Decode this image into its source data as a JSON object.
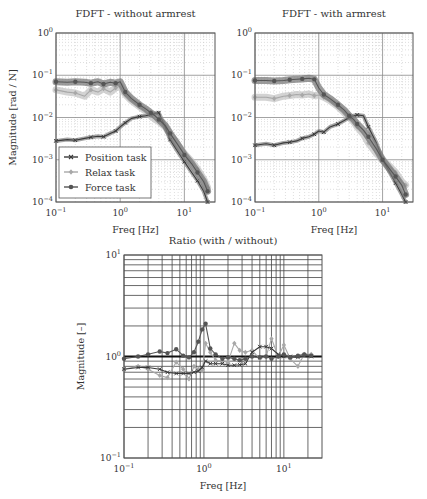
{
  "colors": {
    "position": "#3a3a3a",
    "relax": "#a8a8a8",
    "force": "#555555",
    "band_position": "#8a8a8a",
    "band_relax": "#c4c4c4",
    "band_force": "#7a7a7a",
    "grid_major": "#8c8c8c",
    "grid_minor": "#c8c8c8",
    "frame": "#555555"
  },
  "legend": {
    "items": [
      {
        "label": "Position task",
        "series": "position",
        "marker": "x"
      },
      {
        "label": "Relax task",
        "series": "relax",
        "marker": "diamond"
      },
      {
        "label": "Force task",
        "series": "force",
        "marker": "circle"
      }
    ]
  },
  "chart_data": [
    {
      "type": "line",
      "title": "FDFT - without armrest",
      "xlabel": "Freq [Hz]",
      "ylabel": "Magnitude [rad / N]",
      "xscale": "log",
      "yscale": "log",
      "xlim": [
        0.1,
        30
      ],
      "ylim": [
        0.0001,
        1
      ],
      "xticks": [
        "10^-1",
        "10^0",
        "10^1"
      ],
      "yticks": [
        "10^-4",
        "10^-3",
        "10^-2",
        "10^-1",
        "10^0"
      ],
      "grid": true,
      "legend_position": "lower left",
      "x": [
        0.1,
        0.15,
        0.2,
        0.28,
        0.35,
        0.45,
        0.55,
        0.7,
        0.85,
        1.0,
        1.2,
        1.5,
        2.0,
        2.5,
        3.0,
        3.5,
        4.0,
        5.0,
        6.0,
        8.0,
        10.0,
        13.0,
        16.0,
        20.0,
        23.0
      ],
      "series": [
        {
          "name": "Position task",
          "key": "position",
          "values": [
            0.0028,
            0.003,
            0.0029,
            0.0032,
            0.0034,
            0.0036,
            0.0035,
            0.0042,
            0.0048,
            0.006,
            0.0075,
            0.0095,
            0.0105,
            0.011,
            0.0118,
            0.0125,
            0.013,
            0.006,
            0.003,
            0.0015,
            0.0009,
            0.0005,
            0.00032,
            0.00018,
            0.0001
          ]
        },
        {
          "name": "Relax task",
          "key": "relax",
          "values": [
            0.045,
            0.04,
            0.038,
            0.032,
            0.045,
            0.04,
            0.048,
            0.04,
            0.05,
            0.055,
            0.035,
            0.025,
            0.018,
            0.014,
            0.011,
            0.009,
            0.008,
            0.006,
            0.004,
            0.0022,
            0.0014,
            0.0009,
            0.0006,
            0.00035,
            0.00022
          ]
        },
        {
          "name": "Force task",
          "key": "force",
          "values": [
            0.07,
            0.068,
            0.07,
            0.068,
            0.065,
            0.07,
            0.062,
            0.068,
            0.065,
            0.07,
            0.04,
            0.028,
            0.02,
            0.016,
            0.013,
            0.011,
            0.009,
            0.0065,
            0.0042,
            0.0022,
            0.0013,
            0.0008,
            0.0005,
            0.0003,
            0.00018
          ]
        }
      ]
    },
    {
      "type": "line",
      "title": "FDFT - with armrest",
      "xlabel": "Freq [Hz]",
      "ylabel": "",
      "xscale": "log",
      "yscale": "log",
      "xlim": [
        0.1,
        30
      ],
      "ylim": [
        0.0001,
        1
      ],
      "xticks": [
        "10^-1",
        "10^0",
        "10^1"
      ],
      "yticks": [
        "10^-4",
        "10^-3",
        "10^-2",
        "10^-1",
        "10^0"
      ],
      "grid": true,
      "x": [
        0.1,
        0.15,
        0.2,
        0.28,
        0.35,
        0.45,
        0.55,
        0.7,
        0.85,
        1.0,
        1.2,
        1.5,
        2.0,
        2.5,
        3.0,
        3.5,
        4.0,
        5.0,
        6.0,
        8.0,
        10.0,
        13.0,
        16.0,
        20.0,
        23.0
      ],
      "series": [
        {
          "name": "Position task",
          "key": "position",
          "values": [
            0.0022,
            0.0024,
            0.0022,
            0.0025,
            0.0026,
            0.0028,
            0.0032,
            0.0035,
            0.004,
            0.0048,
            0.0045,
            0.006,
            0.007,
            0.0085,
            0.01,
            0.011,
            0.0115,
            0.011,
            0.006,
            0.0025,
            0.001,
            0.0005,
            0.00028,
            0.00015,
            0.0001
          ]
        },
        {
          "name": "Relax task",
          "key": "relax",
          "values": [
            0.03,
            0.03,
            0.028,
            0.032,
            0.033,
            0.035,
            0.034,
            0.036,
            0.033,
            0.034,
            0.03,
            0.025,
            0.018,
            0.013,
            0.01,
            0.008,
            0.006,
            0.004,
            0.0025,
            0.0014,
            0.001,
            0.0007,
            0.0005,
            0.0003,
            0.00025
          ]
        },
        {
          "name": "Force task",
          "key": "force",
          "values": [
            0.075,
            0.075,
            0.073,
            0.075,
            0.078,
            0.08,
            0.082,
            0.085,
            0.08,
            0.05,
            0.035,
            0.028,
            0.02,
            0.015,
            0.011,
            0.009,
            0.007,
            0.005,
            0.0035,
            0.0018,
            0.001,
            0.0006,
            0.0004,
            0.00025,
            0.00015
          ]
        }
      ]
    },
    {
      "type": "line",
      "title": "Ratio (with / without)",
      "xlabel": "Freq [Hz]",
      "ylabel": "Magnitude [–]",
      "xscale": "log",
      "yscale": "log",
      "xlim": [
        0.1,
        30
      ],
      "ylim": [
        0.1,
        10
      ],
      "xticks": [
        "10^-1",
        "10^0",
        "10^1"
      ],
      "yticks": [
        "10^-1",
        "10^0",
        "10^1"
      ],
      "grid": true,
      "reference_line": 1.0,
      "x": [
        0.1,
        0.15,
        0.2,
        0.28,
        0.35,
        0.45,
        0.55,
        0.65,
        0.75,
        0.85,
        0.95,
        1.05,
        1.2,
        1.4,
        1.7,
        2.0,
        2.4,
        2.8,
        3.3,
        4.0,
        5.0,
        6.0,
        7.0,
        8.5,
        10.0,
        12.0,
        15.0,
        18.0,
        22.0
      ],
      "series": [
        {
          "name": "Position task",
          "key": "position",
          "values": [
            0.75,
            0.78,
            0.78,
            0.75,
            0.7,
            0.68,
            0.68,
            0.68,
            0.7,
            0.72,
            0.78,
            0.9,
            0.85,
            0.85,
            0.85,
            0.82,
            0.82,
            0.83,
            0.85,
            1.1,
            1.25,
            1.25,
            1.2,
            1.05,
            1.0,
            1.0,
            0.98,
            1.02,
            1.0
          ]
        },
        {
          "name": "Relax task",
          "key": "relax",
          "values": [
            0.75,
            0.8,
            0.75,
            0.65,
            0.62,
            0.88,
            0.75,
            0.6,
            0.8,
            0.75,
            0.72,
            1.35,
            1.1,
            0.92,
            0.9,
            0.88,
            1.35,
            1.15,
            1.1,
            1.15,
            0.95,
            1.0,
            1.5,
            1.0,
            1.3,
            0.95,
            0.8,
            1.05,
            1.05
          ]
        },
        {
          "name": "Force task",
          "key": "force",
          "values": [
            0.95,
            1.0,
            1.05,
            1.12,
            1.08,
            1.18,
            1.02,
            0.98,
            1.1,
            1.4,
            1.85,
            2.1,
            1.2,
            1.05,
            0.95,
            0.98,
            0.95,
            0.92,
            0.95,
            1.0,
            0.98,
            1.0,
            0.95,
            1.0,
            1.05,
            0.98,
            1.02,
            1.05,
            1.02
          ]
        }
      ]
    }
  ],
  "layout": {
    "panels": [
      {
        "left": 56,
        "top": 33,
        "right": 215,
        "bottom": 202,
        "minor_grid": true,
        "ytick_labels": true,
        "ylabel": true,
        "legend": true
      },
      {
        "left": 255,
        "top": 33,
        "right": 413,
        "bottom": 202,
        "minor_grid": true,
        "ytick_labels": true,
        "ylabel": false,
        "legend": false
      },
      {
        "left": 124,
        "top": 255,
        "right": 322,
        "bottom": 458,
        "minor_grid": false,
        "ytick_labels": true,
        "ylabel": true,
        "legend": false
      }
    ]
  }
}
